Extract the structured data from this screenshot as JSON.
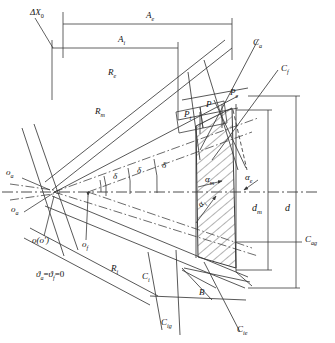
{
  "figure": {
    "type": "engineering-line-drawing",
    "width": 335,
    "height": 343,
    "line_color": "#3a3a3a",
    "hatch_color": "#555555",
    "background": "#ffffff"
  },
  "labels": {
    "delta_x0": "ΔX",
    "delta_x0_sub": "0",
    "A_e": "A",
    "A_e_sub": "e",
    "A_i": "A",
    "A_i_sub": "i",
    "R_e": "R",
    "R_e_sub": "e",
    "R_m": "R",
    "R_m_sub": "m",
    "R_i": "R",
    "R_i_sub": "i",
    "C_a": "C",
    "C_a_sub": "a",
    "C_f": "C",
    "C_f_sub": "f",
    "C_i": "C",
    "C_i_sub": "i",
    "C_ig": "C",
    "C_ig_sub": "ig",
    "C_ie": "C",
    "C_ie_sub": "ie",
    "C_ag": "C",
    "C_ag_sub": "ag",
    "P_i": "P",
    "P_i_sub": "i",
    "P": "P",
    "P_e": "P",
    "P_e_sub": "e",
    "delta1": "δ",
    "delta2": "δ",
    "delta3": "δ",
    "alpha_m": "α",
    "alpha_m_sub": "m",
    "alpha_e": "α",
    "alpha_e_sub": "e",
    "alpha_i": "α",
    "alpha_i_sub": "i",
    "d_m": "d",
    "d_m_sub": "m",
    "d": "d",
    "B": "B",
    "o_a_top": "o",
    "o_a_top_sub": "a",
    "o_a_low": "o",
    "o_a_low_sub": "a",
    "o_prime": "o(o′)",
    "o_f": "o",
    "o_f_sub": "f",
    "condition": "ϑ",
    "condition_sub_a": "a",
    "condition_eq1": "=",
    "condition_f": "ϑ",
    "condition_sub_f": "f",
    "condition_eq2": "=0"
  }
}
